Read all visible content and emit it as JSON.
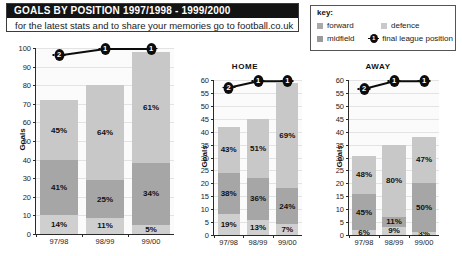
{
  "header": {
    "title": "GOALS BY POSITION 1997/1998 - 1999/2000",
    "subtitle": "for the latest stats and to share your memories go to football.co.uk"
  },
  "key": {
    "title": "key:",
    "items": [
      {
        "label": "forward",
        "swatch": "#a9a9a9",
        "type": "swatch"
      },
      {
        "label": "defence",
        "swatch": "#c9c9c9",
        "type": "swatch"
      },
      {
        "label": "midfield",
        "swatch": "#9a9a9a",
        "type": "swatch"
      },
      {
        "label": "final league position",
        "type": "position"
      }
    ]
  },
  "colors": {
    "forward": "#c8c8c8",
    "midfield": "#a6a6a6",
    "defence": "#cfcfcf",
    "position_marker": "#0c0c0c",
    "title_bar": "#131313"
  },
  "chart_data": [
    {
      "type": "bar",
      "id": "total",
      "title": "",
      "stacked": true,
      "categories": [
        "97/98",
        "98/99",
        "99/00"
      ],
      "ylabel": "Goals",
      "xlabel": "",
      "ylim": [
        0,
        100
      ],
      "ytick_step": 10,
      "yticks": [
        0,
        10,
        20,
        30,
        40,
        50,
        60,
        70,
        80,
        90,
        100
      ],
      "totals": [
        72,
        80,
        98
      ],
      "series": [
        {
          "name": "forward",
          "values": [
            32.4,
            51.2,
            59.8
          ],
          "labels": [
            "45%",
            "64%",
            "61%"
          ]
        },
        {
          "name": "midfield",
          "values": [
            29.5,
            20.0,
            33.3
          ],
          "labels": [
            "41%",
            "25%",
            "34%"
          ]
        },
        {
          "name": "defence",
          "values": [
            10.1,
            8.8,
            4.9
          ],
          "labels": [
            "14%",
            "11%",
            "5%"
          ]
        }
      ],
      "league_positions": [
        2,
        1,
        1
      ],
      "league_position_values": [
        96,
        99.5,
        99.5
      ],
      "grid": true,
      "legend": "external"
    },
    {
      "type": "bar",
      "id": "home",
      "title": "HOME",
      "stacked": true,
      "categories": [
        "97/98",
        "98/99",
        "99/00"
      ],
      "ylabel": "Goals",
      "xlabel": "",
      "ylim": [
        0,
        60
      ],
      "ytick_step": 5,
      "yticks": [
        0,
        5,
        10,
        15,
        20,
        25,
        30,
        35,
        40,
        45,
        50,
        55,
        60
      ],
      "totals": [
        42,
        45,
        59
      ],
      "series": [
        {
          "name": "forward",
          "values": [
            18.1,
            23.0,
            40.7
          ],
          "labels": [
            "43%",
            "51%",
            "69%"
          ]
        },
        {
          "name": "midfield",
          "values": [
            16.0,
            16.2,
            14.2
          ],
          "labels": [
            "38%",
            "36%",
            "24%"
          ]
        },
        {
          "name": "defence",
          "values": [
            8.0,
            5.9,
            4.1
          ],
          "labels": [
            "19%",
            "13%",
            "7%"
          ]
        }
      ],
      "league_positions": [
        2,
        1,
        1
      ],
      "league_position_values": [
        57,
        59.5,
        59.5
      ],
      "grid": true,
      "legend": "external"
    },
    {
      "type": "bar",
      "id": "away",
      "title": "AWAY",
      "stacked": true,
      "categories": [
        "97/98",
        "98/99",
        "99/00"
      ],
      "ylabel": "Goals",
      "xlabel": "",
      "ylim": [
        0,
        60
      ],
      "ytick_step": 5,
      "yticks": [
        0,
        5,
        10,
        15,
        20,
        25,
        30,
        35,
        40,
        45,
        50,
        55,
        60
      ],
      "totals": [
        31,
        35,
        38
      ],
      "series": [
        {
          "name": "forward",
          "values": [
            14.9,
            28.0,
            17.9
          ],
          "labels": [
            "48%",
            "80%",
            "47%"
          ]
        },
        {
          "name": "midfield",
          "values": [
            14.0,
            3.9,
            19.0
          ],
          "labels": [
            "45%",
            "11%",
            "50%"
          ]
        },
        {
          "name": "defence",
          "values": [
            1.9,
            3.2,
            1.1
          ],
          "labels": [
            "6%",
            "9%",
            "3%"
          ]
        }
      ],
      "league_positions": [
        2,
        1,
        1
      ],
      "league_position_values": [
        56.5,
        59.5,
        59.5
      ],
      "grid": true,
      "legend": "external"
    }
  ]
}
